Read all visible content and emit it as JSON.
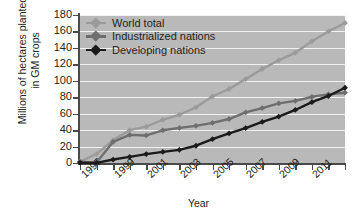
{
  "chart_data": {
    "type": "line",
    "title": "",
    "xlabel": "Year",
    "ylabel_line1": "Millions of hectares planted",
    "ylabel_line2": "in GM crops",
    "xlim": [
      1996,
      2012
    ],
    "ylim": [
      0,
      180
    ],
    "grid": true,
    "legend_position": "top-left",
    "ytick_labels": [
      "0",
      "20",
      "40",
      "60",
      "80",
      "100",
      "120",
      "140",
      "160",
      "180"
    ],
    "ytick_values": [
      0,
      20,
      40,
      60,
      80,
      100,
      120,
      140,
      160,
      180
    ],
    "xtick_values": [
      1996,
      1997,
      1998,
      1999,
      2000,
      2001,
      2002,
      2003,
      2004,
      2005,
      2006,
      2007,
      2008,
      2009,
      2010,
      2011,
      2012
    ],
    "xtick_labels": [
      "",
      "1997",
      "",
      "1999",
      "",
      "2001",
      "",
      "2003",
      "",
      "2005",
      "",
      "2007",
      "",
      "2009",
      "",
      "2011",
      ""
    ],
    "x": [
      1996,
      1997,
      1998,
      1999,
      2000,
      2001,
      2002,
      2003,
      2004,
      2005,
      2006,
      2007,
      2008,
      2009,
      2010,
      2011,
      2012
    ],
    "series": [
      {
        "name": "World total",
        "color": "#9b9b9b",
        "values": [
          1.7,
          11,
          27.8,
          39.9,
          44.2,
          52.6,
          58.7,
          67.7,
          81,
          90,
          102,
          114.3,
          125,
          134,
          148,
          160,
          170.3
        ]
      },
      {
        "name": "Industrialized nations",
        "color": "#6e6e6e",
        "values": [
          1.7,
          0.5,
          25.8,
          34.2,
          33.5,
          39.8,
          42.7,
          45.2,
          48.8,
          53.5,
          61.5,
          66.8,
          72.5,
          75.5,
          80.5,
          83.5,
          85.5
        ]
      },
      {
        "name": "Developing nations",
        "color": "#1a1a1a",
        "values": [
          0.5,
          0.2,
          4.2,
          7.5,
          10.8,
          13.5,
          16,
          21,
          29,
          36,
          42.5,
          50,
          56.5,
          64.5,
          74,
          81.5,
          91.5
        ]
      }
    ]
  },
  "legend": {
    "items": [
      {
        "label": "World total",
        "color": "#9b9b9b"
      },
      {
        "label": "Industrialized nations",
        "color": "#6e6e6e"
      },
      {
        "label": "Developing nations",
        "color": "#1a1a1a"
      }
    ]
  }
}
